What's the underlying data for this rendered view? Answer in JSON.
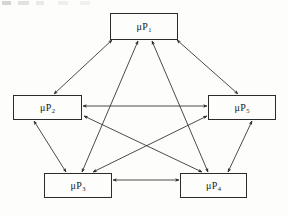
{
  "diagram": {
    "type": "node-link-graph",
    "topology": "complete-graph-K5",
    "background_color": "#fdfdfc",
    "stroke_color": "#2b2b2b",
    "nodes": [
      {
        "id": "up1",
        "prefix": "μP",
        "subscript": "1",
        "label": "μP1",
        "position": "top-center",
        "x": 110,
        "y": 13,
        "width": 68,
        "height": 27
      },
      {
        "id": "up2",
        "prefix": "μP",
        "subscript": "2",
        "label": "μP2",
        "position": "middle-left",
        "x": 13,
        "y": 95,
        "width": 69,
        "height": 25
      },
      {
        "id": "up5",
        "prefix": "μP",
        "subscript": "5",
        "label": "μP5",
        "position": "middle-right",
        "x": 208,
        "y": 95,
        "width": 68,
        "height": 25
      },
      {
        "id": "up3",
        "prefix": "μP",
        "subscript": "3",
        "label": "μP3",
        "position": "bottom-left",
        "x": 44,
        "y": 173,
        "width": 68,
        "height": 25
      },
      {
        "id": "up4",
        "prefix": "μP",
        "subscript": "4",
        "label": "μP4",
        "position": "bottom-right",
        "x": 180,
        "y": 173,
        "width": 67,
        "height": 25
      }
    ],
    "edges": [
      {
        "id": "e-1-2",
        "from": "up1",
        "to": "up2",
        "direction": "bidirectional",
        "x1": 112,
        "y1": 40,
        "x2": 54,
        "y2": 94
      },
      {
        "id": "e-1-5",
        "from": "up1",
        "to": "up5",
        "direction": "bidirectional",
        "x1": 177,
        "y1": 40,
        "x2": 238,
        "y2": 94
      },
      {
        "id": "e-1-3",
        "from": "up1",
        "to": "up3",
        "direction": "bidirectional",
        "x1": 138,
        "y1": 41,
        "x2": 82,
        "y2": 172
      },
      {
        "id": "e-1-4",
        "from": "up1",
        "to": "up4",
        "direction": "bidirectional",
        "x1": 152,
        "y1": 41,
        "x2": 208,
        "y2": 172
      },
      {
        "id": "e-2-5",
        "from": "up2",
        "to": "up5",
        "direction": "bidirectional",
        "x1": 83,
        "y1": 106,
        "x2": 207,
        "y2": 106
      },
      {
        "id": "e-2-3",
        "from": "up2",
        "to": "up3",
        "direction": "bidirectional",
        "x1": 34,
        "y1": 121,
        "x2": 66,
        "y2": 172
      },
      {
        "id": "e-2-4",
        "from": "up2",
        "to": "up4",
        "direction": "bidirectional",
        "x1": 84,
        "y1": 116,
        "x2": 202,
        "y2": 172
      },
      {
        "id": "e-5-3",
        "from": "up5",
        "to": "up3",
        "direction": "bidirectional",
        "x1": 207,
        "y1": 116,
        "x2": 93,
        "y2": 172
      },
      {
        "id": "e-5-4",
        "from": "up5",
        "to": "up4",
        "direction": "bidirectional",
        "x1": 252,
        "y1": 121,
        "x2": 228,
        "y2": 172
      },
      {
        "id": "e-3-4",
        "from": "up3",
        "to": "up4",
        "direction": "bidirectional",
        "x1": 113,
        "y1": 180,
        "x2": 179,
        "y2": 180
      }
    ]
  }
}
